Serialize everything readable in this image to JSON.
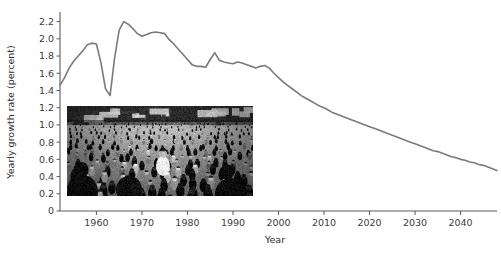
{
  "chart_data": {
    "type": "line",
    "title": "",
    "xlabel": "Year",
    "ylabel": "Yearly growth rate (percent)",
    "xlim": [
      1952,
      2048
    ],
    "ylim": [
      0,
      2.3
    ],
    "grid": false,
    "legend": "none",
    "line_color": "#7a7a7a",
    "y_ticks": [
      "0",
      "0.2",
      "0.4",
      "0.6",
      "0.8",
      "1.0",
      "1.2",
      "1.4",
      "1.6",
      "1.8",
      "2.0",
      "2.2"
    ],
    "y_tick_values": [
      0,
      0.2,
      0.4,
      0.6,
      0.8,
      1.0,
      1.2,
      1.4,
      1.6,
      1.8,
      2.0,
      2.2
    ],
    "x_ticks": [
      "1960",
      "1970",
      "1980",
      "1990",
      "2000",
      "2010",
      "2020",
      "2030",
      "2040"
    ],
    "x_tick_values": [
      1960,
      1970,
      1980,
      1990,
      2000,
      2010,
      2020,
      2030,
      2040
    ],
    "x": [
      1952,
      1953,
      1954,
      1955,
      1956,
      1957,
      1958,
      1959,
      1960,
      1961,
      1962,
      1963,
      1964,
      1965,
      1966,
      1967,
      1968,
      1969,
      1970,
      1971,
      1972,
      1973,
      1974,
      1975,
      1976,
      1977,
      1978,
      1979,
      1980,
      1981,
      1982,
      1983,
      1984,
      1985,
      1986,
      1987,
      1988,
      1989,
      1990,
      1991,
      1992,
      1993,
      1994,
      1995,
      1996,
      1997,
      1998,
      1999,
      2000,
      2001,
      2002,
      2003,
      2004,
      2005,
      2006,
      2007,
      2008,
      2009,
      2010,
      2011,
      2012,
      2013,
      2014,
      2015,
      2016,
      2017,
      2018,
      2019,
      2020,
      2021,
      2022,
      2023,
      2024,
      2025,
      2026,
      2027,
      2028,
      2029,
      2030,
      2031,
      2032,
      2033,
      2034,
      2035,
      2036,
      2037,
      2038,
      2039,
      2040,
      2041,
      2042,
      2043,
      2044,
      2045,
      2046,
      2047,
      2048
    ],
    "y": [
      1.46,
      1.55,
      1.66,
      1.74,
      1.8,
      1.86,
      1.93,
      1.95,
      1.94,
      1.72,
      1.42,
      1.34,
      1.78,
      2.1,
      2.2,
      2.17,
      2.12,
      2.06,
      2.03,
      2.05,
      2.07,
      2.08,
      2.07,
      2.06,
      1.99,
      1.94,
      1.88,
      1.82,
      1.76,
      1.7,
      1.68,
      1.68,
      1.67,
      1.76,
      1.84,
      1.75,
      1.73,
      1.72,
      1.71,
      1.73,
      1.72,
      1.7,
      1.68,
      1.66,
      1.68,
      1.69,
      1.66,
      1.6,
      1.55,
      1.5,
      1.46,
      1.42,
      1.38,
      1.34,
      1.31,
      1.28,
      1.25,
      1.22,
      1.2,
      1.17,
      1.14,
      1.12,
      1.1,
      1.08,
      1.06,
      1.04,
      1.02,
      1.0,
      0.98,
      0.96,
      0.94,
      0.92,
      0.9,
      0.88,
      0.86,
      0.84,
      0.82,
      0.8,
      0.78,
      0.76,
      0.74,
      0.72,
      0.7,
      0.69,
      0.67,
      0.65,
      0.63,
      0.62,
      0.6,
      0.59,
      0.57,
      0.56,
      0.54,
      0.53,
      0.51,
      0.49,
      0.47
    ],
    "inset_image": {
      "caption": "",
      "description": "black-and-white photograph of a dense crowd of people in a street"
    }
  }
}
